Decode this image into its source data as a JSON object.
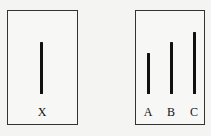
{
  "figure": {
    "reference_card": {
      "lines": [
        {
          "label": "X",
          "height_px": 52
        }
      ]
    },
    "comparison_card": {
      "lines": [
        {
          "label": "A",
          "height_px": 41
        },
        {
          "label": "B",
          "height_px": 52
        },
        {
          "label": "C",
          "height_px": 62
        }
      ]
    }
  }
}
